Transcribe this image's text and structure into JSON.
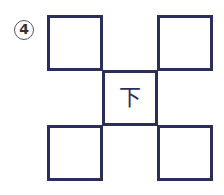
{
  "problem": {
    "number": "4",
    "center_character": "下",
    "cells": [
      {
        "pos": "top-left",
        "text": ""
      },
      {
        "pos": "top-right",
        "text": ""
      },
      {
        "pos": "center",
        "text": "下"
      },
      {
        "pos": "bottom-left",
        "text": ""
      },
      {
        "pos": "bottom-right",
        "text": ""
      }
    ]
  },
  "colors": {
    "line": "#2b2d5a"
  }
}
